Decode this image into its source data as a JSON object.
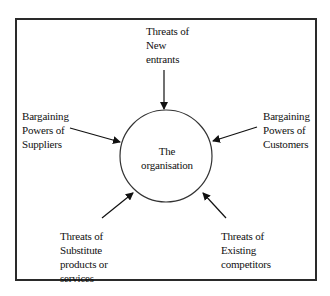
{
  "diagram": {
    "center": {
      "lines": [
        "The",
        "organisation"
      ]
    },
    "forces": [
      {
        "id": "new-entrants",
        "lines": [
          "Threats of",
          "New",
          "entrants"
        ]
      },
      {
        "id": "suppliers",
        "lines": [
          "Bargaining",
          "Powers of",
          "Suppliers"
        ]
      },
      {
        "id": "customers",
        "lines": [
          "Bargaining",
          "Powers of",
          "Customers"
        ]
      },
      {
        "id": "substitutes",
        "lines": [
          "Threats of",
          "Substitute",
          "products or",
          "services"
        ]
      },
      {
        "id": "competitors",
        "lines": [
          "Threats of",
          "Existing",
          "competitors"
        ]
      }
    ],
    "colors": {
      "stroke": "#2a2a2a",
      "background": "#ffffff"
    }
  }
}
